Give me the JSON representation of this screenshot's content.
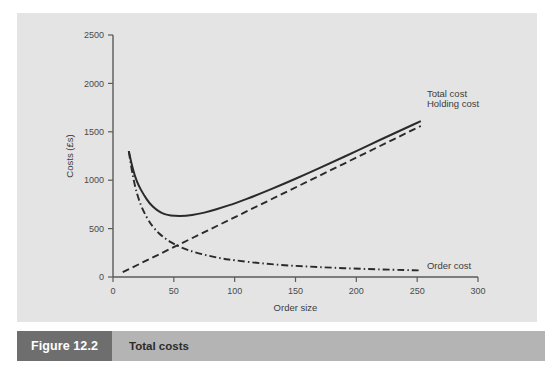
{
  "figure": {
    "tag": "Figure 12.2",
    "caption": "Total costs"
  },
  "chart_data": {
    "type": "line",
    "title": "",
    "xlabel": "Order size",
    "ylabel": "Costs (£s)",
    "xlim": [
      0,
      300
    ],
    "ylim": [
      0,
      2500
    ],
    "xticks": [
      0,
      50,
      100,
      150,
      200,
      250,
      300
    ],
    "yticks": [
      0,
      500,
      1000,
      1500,
      2000,
      2500
    ],
    "grid": false,
    "legend_position": "inline-right-of-lines",
    "annotations": [
      {
        "text": "Total cost",
        "x": 258,
        "y": 1890
      },
      {
        "text": "Holding cost",
        "x": 258,
        "y": 1790
      },
      {
        "text": "Order cost",
        "x": 258,
        "y": 120
      }
    ],
    "series": [
      {
        "name": "Total cost",
        "style": "solid",
        "color": "#2a2a2a",
        "x": [
          13,
          15,
          18,
          21,
          25,
          30,
          35,
          40,
          45,
          50,
          60,
          70,
          80,
          90,
          100,
          120,
          140,
          160,
          180,
          200,
          220,
          240,
          253
        ],
        "values": [
          1300,
          1180,
          1040,
          945,
          855,
          760,
          700,
          660,
          640,
          630,
          630,
          650,
          680,
          720,
          760,
          855,
          960,
          1070,
          1185,
          1300,
          1420,
          1535,
          1610
        ]
      },
      {
        "name": "Holding cost",
        "style": "dashed",
        "color": "#2a2a2a",
        "x": [
          8,
          253
        ],
        "values": [
          50,
          1560
        ]
      },
      {
        "name": "Order cost",
        "style": "dashdot",
        "color": "#2a2a2a",
        "x": [
          13,
          15,
          18,
          21,
          25,
          30,
          35,
          40,
          45,
          50,
          60,
          70,
          80,
          90,
          100,
          120,
          140,
          160,
          180,
          200,
          220,
          240,
          253
        ],
        "values": [
          1300,
          1130,
          940,
          805,
          680,
          565,
          485,
          425,
          380,
          340,
          285,
          245,
          215,
          190,
          172,
          143,
          122,
          108,
          96,
          86,
          78,
          72,
          68
        ]
      }
    ]
  },
  "icons": {
    "chart_panel": "line-chart-panel"
  }
}
